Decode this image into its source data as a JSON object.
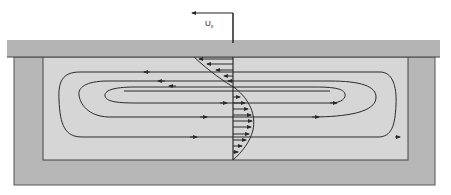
{
  "diagram": {
    "velocity_label": "U",
    "velocity_subscript": "x",
    "colors": {
      "lid": "#b4b4b4",
      "outer_wall": "#b7b7b7",
      "cavity_fluid": "#d6d6d6",
      "lines": "#2a2a2a",
      "background": "#ffffff"
    },
    "components": [
      "moving-lid",
      "outer-wall",
      "cavity",
      "streamlines",
      "velocity-profile",
      "lid-velocity-arrow"
    ]
  }
}
